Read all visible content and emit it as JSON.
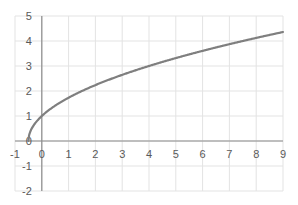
{
  "chart_data": {
    "type": "line",
    "title": "",
    "xlabel": "",
    "ylabel": "",
    "xlim": [
      -1,
      9
    ],
    "ylim": [
      -2,
      5
    ],
    "grid": true,
    "legend": null,
    "x_ticks": [
      "-1",
      "0",
      "1",
      "2",
      "3",
      "4",
      "5",
      "6",
      "7",
      "8",
      "9"
    ],
    "y_ticks": [
      "5",
      "4",
      "3",
      "2",
      "1",
      "0",
      "-1",
      "-2"
    ],
    "series": [
      {
        "name": "y = sqrt(2x+1)",
        "color": "#7f7f7f",
        "x": [
          -0.5,
          -0.45,
          -0.4,
          -0.3,
          -0.2,
          0,
          0.5,
          1,
          1.5,
          2,
          3,
          4,
          5,
          6,
          7,
          8,
          9
        ],
        "values": [
          0,
          0.32,
          0.45,
          0.63,
          0.77,
          1.0,
          1.41,
          1.73,
          2.0,
          2.24,
          2.65,
          3.0,
          3.32,
          3.61,
          3.87,
          4.12,
          4.36
        ]
      }
    ]
  },
  "colors": {
    "grid": "#e3e3e3",
    "axis": "#8c8c8c",
    "line": "#7f7f7f"
  }
}
